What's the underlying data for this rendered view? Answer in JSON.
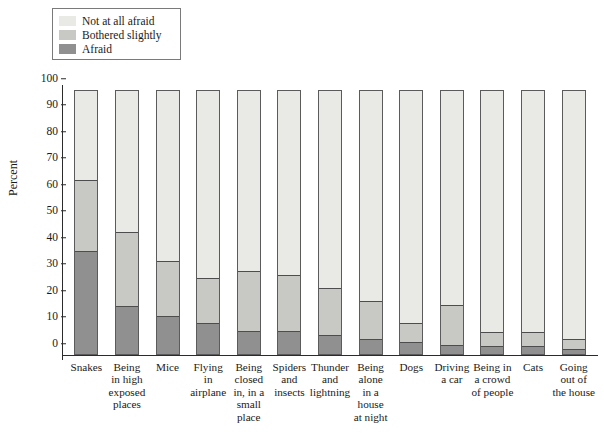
{
  "chart_data": {
    "type": "bar",
    "subtype": "stacked-bar-100-percent",
    "title": "",
    "xlabel": "",
    "ylabel": "Percent",
    "ylim": [
      0,
      100
    ],
    "yticks": [
      0,
      10,
      20,
      30,
      40,
      50,
      60,
      70,
      80,
      90,
      100
    ],
    "grid": false,
    "legend_position": "top-left",
    "stack_order_bottom_to_top": [
      "Afraid",
      "Bothered slightly",
      "Not at all afraid"
    ],
    "categories": [
      "Snakes",
      "Being in high exposed places",
      "Mice",
      "Flying in airplane",
      "Being closed in, in a small place",
      "Spiders and insects",
      "Thunder and lightning",
      "Being alone in a house at night",
      "Dogs",
      "Driving a car",
      "Being in a crowd of people",
      "Cats",
      "Going out of the house"
    ],
    "category_label_lines": [
      [
        "Snakes"
      ],
      [
        "Being",
        "in high",
        "exposed",
        "places"
      ],
      [
        "Mice"
      ],
      [
        "Flying",
        "in",
        "airplane"
      ],
      [
        "Being",
        "closed",
        "in, in a",
        "small",
        "place"
      ],
      [
        "Spiders",
        "and",
        "insects"
      ],
      [
        "Thunder",
        "and",
        "lightning"
      ],
      [
        "Being",
        "alone",
        "in a",
        "house",
        "at night"
      ],
      [
        "Dogs"
      ],
      [
        "Driving",
        "a car"
      ],
      [
        "Being in",
        "a crowd",
        "of people"
      ],
      [
        "Cats"
      ],
      [
        "Going",
        "out of",
        "the house"
      ]
    ],
    "series": [
      {
        "name": "Afraid",
        "color": "#909090",
        "values": [
          39,
          18,
          14.5,
          11.8,
          8.7,
          8.5,
          7.3,
          5.6,
          4.5,
          3.3,
          3.2,
          3.2,
          1.8
        ]
      },
      {
        "name": "Bothered slightly",
        "color": "#c8c8c5",
        "values": [
          26.5,
          28,
          20.5,
          17,
          22.8,
          21.5,
          17.7,
          14.4,
          7.2,
          15.2,
          5.1,
          5.1,
          3.7
        ]
      },
      {
        "name": "Not at all afraid",
        "color": "#e9e9e6",
        "values": [
          34.5,
          54,
          65,
          71.2,
          68.5,
          70,
          75,
          80,
          88.3,
          81.5,
          91.7,
          91.7,
          94.5
        ]
      }
    ],
    "cumulative_tops": {
      "afraid": [
        39,
        18,
        14.5,
        11.8,
        8.7,
        8.5,
        7.3,
        5.6,
        4.5,
        3.3,
        3.2,
        3.2,
        1.8
      ],
      "afraid_plus_bothered": [
        65.5,
        46,
        35,
        28.8,
        31.5,
        30,
        25,
        20,
        11.7,
        18.5,
        8.3,
        8.3,
        5.5
      ]
    }
  },
  "legend": {
    "items": [
      {
        "label": "Not at all afraid",
        "color": "#e9e9e6"
      },
      {
        "label": "Bothered slightly",
        "color": "#c8c8c5"
      },
      {
        "label": "Afraid",
        "color": "#909090"
      }
    ]
  },
  "axes": {
    "y_title": "Percent"
  }
}
